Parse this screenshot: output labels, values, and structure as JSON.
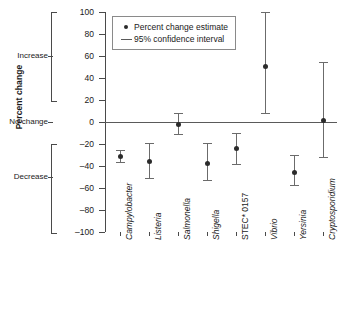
{
  "chart_data": {
    "type": "scatter",
    "title": "",
    "xlabel": "",
    "ylabel": "Percent change",
    "ylim": [
      -100,
      100
    ],
    "grid": false,
    "legend_position": "top-left",
    "categories": [
      "Campylobacter",
      "Listeria",
      "Salmonella",
      "Shigella",
      "STEC* 0157",
      "Vibrio",
      "Yersinia",
      "Cryptosporidium"
    ],
    "yticks": [
      100,
      80,
      60,
      40,
      20,
      0,
      -20,
      -40,
      -60,
      -80,
      -100
    ],
    "ytick_labels": [
      "100",
      "80",
      "60",
      "40",
      "20",
      "0",
      "–20",
      "–40",
      "–60",
      "–80",
      "–100"
    ],
    "y_zone_labels": [
      {
        "label": "Increase",
        "value": 60
      },
      {
        "label": "No change",
        "value": 0
      },
      {
        "label": "Decrease",
        "value": -50
      }
    ],
    "series": [
      {
        "name": "Percent change estimate",
        "values": [
          -31,
          -35,
          -2,
          -37,
          -24,
          51,
          -45,
          2
        ]
      },
      {
        "name": "95% confidence interval",
        "lower": [
          -36,
          -51,
          -11,
          -53,
          -38,
          8,
          -57,
          -32
        ],
        "upper": [
          -25,
          -19,
          8,
          -19,
          -10,
          100,
          -30,
          55
        ]
      }
    ],
    "legend": [
      {
        "label": "Percent change estimate",
        "marker": "dot"
      },
      {
        "label": "95% confidence interval",
        "marker": "line"
      }
    ]
  }
}
